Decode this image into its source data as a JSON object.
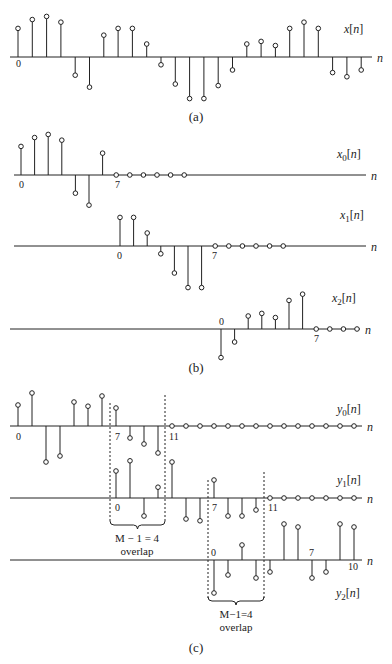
{
  "figure": {
    "panel_a": {
      "caption": "(a)",
      "signal_label": "x[n]",
      "axis_label": "n",
      "origin_label": "0",
      "values": [
        0.55,
        0.72,
        0.78,
        0.67,
        -0.35,
        -0.58,
        0.42,
        0.55,
        0.55,
        0.25,
        -0.15,
        -0.52,
        -0.8,
        -0.8,
        -0.55,
        -0.25,
        0.25,
        0.3,
        0.22,
        0.55,
        0.67,
        0.55,
        -0.3,
        -0.38,
        -0.25
      ]
    },
    "panel_b": {
      "caption": "(b)",
      "segments": [
        {
          "signal_label": "x0[n]",
          "origin_label": "0",
          "end_label": "7",
          "axis_label": "n",
          "values": [
            0.55,
            0.72,
            0.78,
            0.67,
            -0.35,
            -0.58,
            0.42
          ],
          "zero_count": 6
        },
        {
          "signal_label": "x1[n]",
          "origin_label": "0",
          "end_label": "7",
          "axis_label": "n",
          "values": [
            0.55,
            0.55,
            0.25,
            -0.15,
            -0.52,
            -0.8,
            -0.8
          ],
          "zero_count": 6
        },
        {
          "signal_label": "x2[n]",
          "origin_label": "0",
          "end_label": "7",
          "axis_label": "n",
          "values": [
            -0.55,
            -0.25,
            0.25,
            0.3,
            0.22,
            0.55,
            0.67
          ],
          "zero_count": 4
        }
      ]
    },
    "panel_c": {
      "caption": "(c)",
      "segments": [
        {
          "signal_label": "y0[n]",
          "labels": [
            "0",
            "7",
            "11"
          ],
          "axis_label": "n",
          "values": [
            0.35,
            0.55,
            -0.6,
            -0.5,
            0.4,
            0.33,
            0.5,
            0.3,
            -0.2,
            -0.3,
            -0.45
          ],
          "zero_count": 14
        },
        {
          "signal_label": "y1[n]",
          "labels": [
            "0",
            "7",
            "11"
          ],
          "axis_label": "n",
          "values": [
            0.45,
            0.62,
            -0.3,
            0.18,
            0.6,
            -0.35,
            -0.38,
            0.3,
            -0.3,
            -0.3,
            -0.2
          ],
          "zero_count": 7
        },
        {
          "signal_label": "y2[n]",
          "labels": [
            "0",
            "7",
            "10"
          ],
          "axis_label": "n",
          "values": [
            -0.55,
            -0.25,
            0.25,
            -0.3,
            -0.2,
            0.6,
            0.55,
            -0.3,
            -0.2,
            0.6,
            0.55
          ],
          "zero_count": 0
        }
      ],
      "overlap_annotations": [
        {
          "text_line1": "M − 1 = 4",
          "text_line2": "overlap"
        },
        {
          "text_line1": "M−1=4",
          "text_line2": "overlap"
        }
      ]
    }
  }
}
